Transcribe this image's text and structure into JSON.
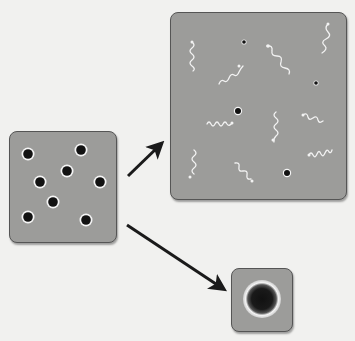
{
  "diagram": {
    "colors": {
      "background": "#f1f1ef",
      "panel_fill": "#9c9c9a",
      "panel_border": "#555555",
      "particle_core": "#111111",
      "particle_halo": "#f5f5f5",
      "photon": "#f2f2f2",
      "arrow": "#1a1a1a"
    },
    "panels": [
      {
        "id": "initial-state",
        "x": 9,
        "y": 131,
        "w": 108,
        "h": 112,
        "particle_count": 8
      },
      {
        "id": "radiation-state",
        "x": 170,
        "y": 12,
        "w": 177,
        "h": 188,
        "particle_count": 5,
        "photon_count": 11
      },
      {
        "id": "collapsed-state",
        "x": 231,
        "y": 268,
        "w": 62,
        "h": 64,
        "particle_count": 1
      }
    ],
    "arrows": [
      {
        "id": "arrow-to-radiation",
        "from": [
          128,
          176
        ],
        "to": [
          166,
          140
        ]
      },
      {
        "id": "arrow-to-collapse",
        "from": [
          127,
          225
        ],
        "to": [
          229,
          292
        ]
      }
    ]
  }
}
